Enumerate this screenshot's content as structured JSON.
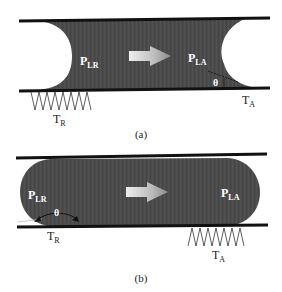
{
  "panels": [
    {
      "id": "a",
      "caption": "(a)",
      "labels": {
        "pressure_receding": {
          "main": "P",
          "sub": "LR"
        },
        "pressure_advancing": {
          "main": "P",
          "sub": "LA"
        },
        "angle": "θ",
        "temp_receding": {
          "main": "T",
          "sub": "R"
        },
        "temp_advancing": {
          "main": "T",
          "sub": "A"
        }
      },
      "meniscus_shape": "concave",
      "heater_side": "receding"
    },
    {
      "id": "b",
      "caption": "(b)",
      "labels": {
        "pressure_receding": {
          "main": "P",
          "sub": "LR"
        },
        "pressure_advancing": {
          "main": "P",
          "sub": "LA"
        },
        "angle": "θ",
        "temp_receding": {
          "main": "T",
          "sub": "R"
        },
        "temp_advancing": {
          "main": "T",
          "sub": "A"
        }
      },
      "meniscus_shape": "convex",
      "heater_side": "advancing"
    }
  ],
  "colors": {
    "plug": "#4a4a4a",
    "wall": "#111111",
    "arrow_light": "#e6e6e6",
    "arrow_dark": "#8a8a8a",
    "background": "#ffffff"
  },
  "flow_direction": "right"
}
